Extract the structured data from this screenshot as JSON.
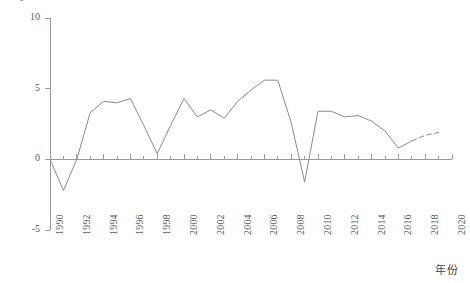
{
  "chart_data": {
    "type": "line",
    "title": "",
    "xlabel": "年份",
    "ylabel": "GDP 增速/%",
    "xlim": [
      1990,
      2020
    ],
    "ylim": [
      -5,
      10
    ],
    "grid": false,
    "legend": "none",
    "y_ticks": [
      10,
      5,
      0,
      -5
    ],
    "y_tick_labels": [
      "10",
      "5",
      "0",
      "-5"
    ],
    "x_ticks": [
      1990,
      1992,
      1994,
      1996,
      1998,
      2000,
      2002,
      2004,
      2006,
      2008,
      2010,
      2012,
      2014,
      2016,
      2018,
      2020
    ],
    "x_tick_labels": [
      "1990",
      "1992",
      "1994",
      "1996",
      "1998",
      "2000",
      "2002",
      "2004",
      "2006",
      "2008",
      "2010",
      "2012",
      "2014",
      "2016",
      "2018",
      "2020"
    ],
    "x_minor_ticks": [
      1991,
      1993,
      1995,
      1997,
      1999,
      2001,
      2003,
      2005,
      2007,
      2009,
      2011,
      2013,
      2015,
      2017,
      2019
    ],
    "line_color": "#8a8a8a",
    "line_width": 1,
    "series": [
      {
        "name": "GDP 增速",
        "style": "solid",
        "x": [
          1990,
          1991,
          1992,
          1993,
          1994,
          1995,
          1996,
          1997,
          1998,
          1999,
          2000,
          2001,
          2002,
          2003,
          2004,
          2005,
          2006,
          2007,
          2008,
          2009,
          2010,
          2011,
          2012,
          2013,
          2014,
          2015,
          2016,
          2017
        ],
        "values": [
          0.0,
          -2.2,
          0.0,
          3.3,
          4.1,
          4.0,
          4.3,
          2.4,
          0.4,
          2.4,
          4.3,
          3.0,
          3.5,
          2.9,
          4.1,
          4.9,
          5.6,
          5.6,
          2.6,
          -1.6,
          3.4,
          3.4,
          3.0,
          3.1,
          2.7,
          2.0,
          0.8,
          1.3
        ]
      },
      {
        "name": "GDP 增速（预测）",
        "style": "dashed",
        "x": [
          2017,
          2018,
          2019
        ],
        "values": [
          1.3,
          1.7,
          1.9
        ]
      }
    ]
  }
}
